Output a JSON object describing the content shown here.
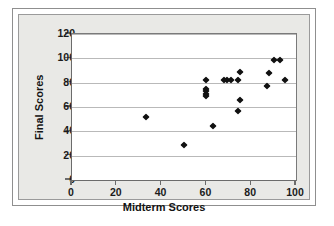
{
  "chart_data": {
    "type": "scatter",
    "title": "",
    "xlabel": "Midterm Scores",
    "ylabel": "Final Scores",
    "xlim": [
      0,
      100
    ],
    "ylim": [
      0,
      120
    ],
    "xticks": [
      0,
      20,
      40,
      60,
      80,
      100
    ],
    "yticks": [
      0,
      20,
      40,
      60,
      80,
      100,
      120
    ],
    "xtick_labels": [
      "0",
      "20",
      "40",
      "60",
      "80",
      "100"
    ],
    "ytick_labels": [
      "0",
      "20",
      "40",
      "60",
      "80",
      "100",
      "120"
    ],
    "grid": "horizontal",
    "legend": "none",
    "marker": "diamond",
    "marker_color": "#111111",
    "points": [
      {
        "x": 33,
        "y": 52
      },
      {
        "x": 50,
        "y": 29
      },
      {
        "x": 60,
        "y": 82
      },
      {
        "x": 60,
        "y": 75
      },
      {
        "x": 60,
        "y": 73
      },
      {
        "x": 60,
        "y": 71
      },
      {
        "x": 60,
        "y": 69
      },
      {
        "x": 63,
        "y": 44
      },
      {
        "x": 68,
        "y": 82
      },
      {
        "x": 69,
        "y": 82
      },
      {
        "x": 71,
        "y": 82
      },
      {
        "x": 74,
        "y": 82
      },
      {
        "x": 75,
        "y": 89
      },
      {
        "x": 75,
        "y": 66
      },
      {
        "x": 74,
        "y": 57
      },
      {
        "x": 88,
        "y": 88
      },
      {
        "x": 87,
        "y": 77
      },
      {
        "x": 90,
        "y": 99
      },
      {
        "x": 93,
        "y": 99
      },
      {
        "x": 95,
        "y": 82
      }
    ]
  },
  "colors": {
    "plot_background": "#ffffff",
    "panel_background": "#e9e9e6",
    "gridline": "#b9b9b9",
    "axis": "#6b6b6b",
    "text": "#141414"
  }
}
